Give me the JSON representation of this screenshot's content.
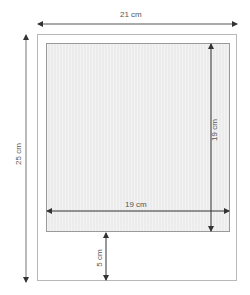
{
  "diagram": {
    "type": "frame-dimensions",
    "outer_frame": {
      "width_label": "21 cm",
      "height_label": "25 cm"
    },
    "inner_area": {
      "width_label": "19 cm",
      "height_label": "19 cm"
    },
    "bottom_margin_label": "5 cm",
    "colors": {
      "outer_border": "#b8b8b8",
      "inner_fill": "#ececec",
      "inner_border": "#9a9a9a",
      "arrow": "#333333",
      "label": "#555555"
    }
  }
}
